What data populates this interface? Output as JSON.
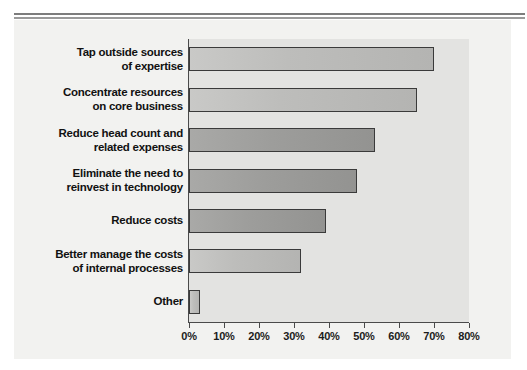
{
  "chart_data": {
    "type": "bar",
    "orientation": "horizontal",
    "title": "",
    "xlabel": "",
    "ylabel": "",
    "xlim": [
      0,
      80
    ],
    "grid": false,
    "legend": null,
    "categories": [
      "Tap outside sources of expertise",
      "Concentrate resources on core business",
      "Reduce head count and related expenses",
      "Eliminate the need to reinvest in technology",
      "Reduce costs",
      "Better manage the costs of internal processes",
      "Other"
    ],
    "category_lines": [
      [
        "Tap outside sources",
        "of expertise"
      ],
      [
        "Concentrate resources",
        "on core business"
      ],
      [
        "Reduce head count and",
        "related expenses"
      ],
      [
        "Eliminate the need to",
        "reinvest in technology"
      ],
      [
        "Reduce costs"
      ],
      [
        "Better manage the costs",
        "of internal processes"
      ],
      [
        "Other"
      ]
    ],
    "values": [
      70,
      65,
      53,
      48,
      39,
      32,
      3
    ],
    "value_unit": "%",
    "xticks": [
      0,
      10,
      20,
      30,
      40,
      50,
      60,
      70,
      80
    ],
    "xticklabels": [
      "0%",
      "10%",
      "20%",
      "30%",
      "40%",
      "50%",
      "60%",
      "70%",
      "80%"
    ],
    "bar_shades": [
      "light",
      "light",
      "dark",
      "dark",
      "dark",
      "light",
      "light"
    ],
    "colors": {
      "plot_background": "#e3e3e1",
      "panel_background": "#f2f2f0",
      "bar_light": "#c2c2c0",
      "bar_dark": "#9d9d9b",
      "bar_border": "#3a3a3a",
      "axis": "#4a4a4a",
      "text": "#111111",
      "rule": "#8b8b8b"
    }
  }
}
